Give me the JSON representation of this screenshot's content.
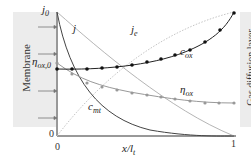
{
  "figure": {
    "left_panel_label": "Membrane",
    "right_panel_label": "Gas diffusion layer",
    "y_axis": {
      "top_label": "j",
      "top_label_sub": "0",
      "bottom_label": "0",
      "mid_label": "η",
      "mid_label_sub": "ox,0"
    },
    "x_axis": {
      "label": "x/l",
      "label_sub": "t",
      "ticks": [
        "0",
        "1"
      ]
    },
    "curves": [
      {
        "name": "j",
        "label": "j",
        "style": "solid",
        "color": "#b0b0b0"
      },
      {
        "name": "je",
        "label": "j",
        "label_sub": "e",
        "style": "dotted",
        "color": "#c0c0c0"
      },
      {
        "name": "cox",
        "label": "c",
        "label_sub": "ox",
        "style": "solid-markers",
        "color": "#222222"
      },
      {
        "name": "eta_ox",
        "label": "η",
        "label_sub": "ox",
        "style": "solid-markers",
        "color": "#888888"
      },
      {
        "name": "cmt",
        "label": "c",
        "label_sub": "mt",
        "style": "solid",
        "color": "#444444"
      }
    ],
    "arrows_count": 4
  }
}
